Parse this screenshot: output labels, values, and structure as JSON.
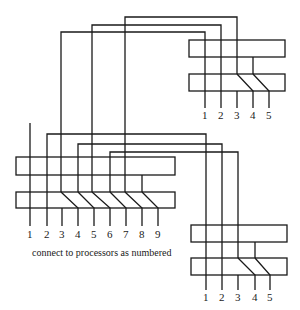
{
  "diagram": {
    "caption": "connect to processors as numbered",
    "left_block": {
      "labels": [
        "1",
        "2",
        "3",
        "4",
        "5",
        "6",
        "7",
        "8",
        "9"
      ]
    },
    "top_right_block": {
      "labels": [
        "1",
        "2",
        "3",
        "4",
        "5"
      ]
    },
    "bottom_right_block": {
      "labels": [
        "1",
        "2",
        "3",
        "4",
        "5"
      ]
    }
  }
}
